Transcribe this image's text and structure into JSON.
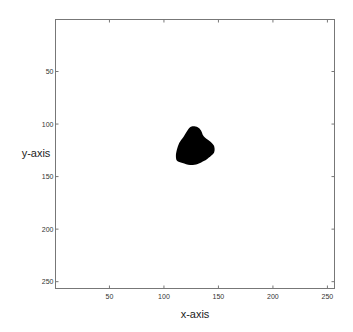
{
  "chart_data": {
    "type": "heatmap",
    "title": "",
    "xlabel": "x-axis",
    "ylabel": "y-axis",
    "xlim": [
      0.5,
      256.5
    ],
    "ylim": [
      0.5,
      256.5
    ],
    "y_reversed": true,
    "xticks": [
      50,
      100,
      150,
      200,
      250
    ],
    "yticks": [
      50,
      100,
      150,
      200,
      250
    ],
    "grid": false,
    "background_color": "#ffffff",
    "foreground_color": "#000000",
    "blob": {
      "center": [
        127,
        122
      ],
      "bbox_x": [
        111,
        146
      ],
      "bbox_y": [
        102,
        139
      ],
      "outline": [
        [
          127,
          102
        ],
        [
          131,
          103
        ],
        [
          134,
          106
        ],
        [
          136,
          111
        ],
        [
          139,
          114
        ],
        [
          143,
          117
        ],
        [
          146,
          121
        ],
        [
          146,
          127
        ],
        [
          141,
          132
        ],
        [
          137,
          135
        ],
        [
          131,
          138
        ],
        [
          124,
          139
        ],
        [
          117,
          137
        ],
        [
          112,
          135
        ],
        [
          111,
          130
        ],
        [
          112,
          124
        ],
        [
          114,
          118
        ],
        [
          118,
          112
        ],
        [
          121,
          107
        ],
        [
          124,
          103
        ]
      ]
    }
  }
}
